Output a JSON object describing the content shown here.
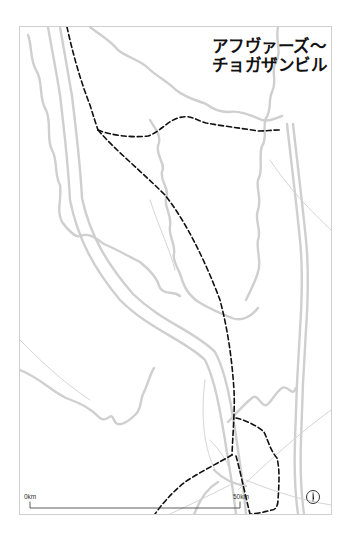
{
  "map": {
    "title_line1": "アフヴァーズ〜",
    "title_line2": "チョガザンビル",
    "scale": {
      "start_label": "0km",
      "end_label": "50km"
    },
    "compass": {
      "icon": "north-arrow-icon"
    },
    "colors": {
      "background": "#ffffff",
      "frame": "#cfcfcf",
      "rivers": "#c8c8c8",
      "roads": "#bdbdbd",
      "route": "#111111",
      "text": "#111111"
    },
    "legend": {
      "route_style": "dashed-black",
      "river_style": "double-grey"
    }
  }
}
